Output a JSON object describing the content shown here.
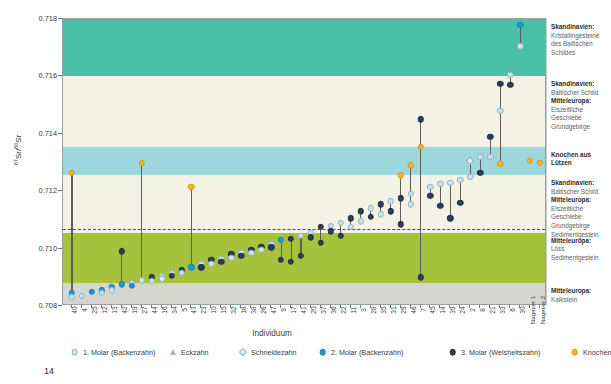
{
  "chart_data": {
    "type": "scatter",
    "title": "",
    "xlabel": "Individuum",
    "ylabel": "87Sr/86Sr",
    "ylim": [
      0.708,
      0.718
    ],
    "yticks": [
      "0.708",
      "0.710",
      "0.712",
      "0.714",
      "0.716",
      "0.718"
    ],
    "grid": false,
    "legend_position": "bottom",
    "reference_line": 0.7107,
    "categories": [
      "40",
      "4",
      "25",
      "12",
      "13",
      "42",
      "19",
      "27",
      "44",
      "16",
      "34",
      "5",
      "43",
      "23",
      "10",
      "15",
      "32",
      "18",
      "38",
      "26",
      "47",
      "9",
      "17",
      "41",
      "20",
      "37",
      "36",
      "22",
      "11",
      "3",
      "28",
      "35",
      "31",
      "29",
      "46",
      "7",
      "45",
      "14",
      "39",
      "24",
      "2",
      "8",
      "21",
      "33",
      "6",
      "30",
      "Nagetier 1",
      "Nagetier 2"
    ],
    "series": [
      {
        "name": "1. Molar (Backenzahn)",
        "marker": "circle-light",
        "color": "#cfe2ea"
      },
      {
        "name": "Eckzahn",
        "marker": "triangle-outline",
        "color": "#b9cfd8"
      },
      {
        "name": "Schneidezahn",
        "marker": "diamond-outline",
        "color": "#cfe2ea"
      },
      {
        "name": "2. Molar (Backenzahn)",
        "marker": "circle-filled",
        "color": "#1c9ad6"
      },
      {
        "name": "3. Molar (Weisheitszahn)",
        "marker": "circle-filled",
        "color": "#2d3f55"
      },
      {
        "name": "Knochen",
        "marker": "circle-filled",
        "color": "#f4b52a"
      }
    ],
    "points": [
      {
        "x": "40",
        "y": 0.70845,
        "t": "m2"
      },
      {
        "x": "40",
        "y": 0.7083,
        "t": "m1"
      },
      {
        "x": "40",
        "y": 0.71265,
        "t": "kn"
      },
      {
        "x": "4",
        "y": 0.70835,
        "t": "m1"
      },
      {
        "x": "4",
        "y": 0.70825,
        "t": "ec"
      },
      {
        "x": "25",
        "y": 0.7085,
        "t": "m2"
      },
      {
        "x": "12",
        "y": 0.70855,
        "t": "m2"
      },
      {
        "x": "12",
        "y": 0.70845,
        "t": "m1"
      },
      {
        "x": "13",
        "y": 0.70865,
        "t": "m2"
      },
      {
        "x": "13",
        "y": 0.70855,
        "t": "m1"
      },
      {
        "x": "42",
        "y": 0.70875,
        "t": "m2"
      },
      {
        "x": "42",
        "y": 0.7099,
        "t": "m3"
      },
      {
        "x": "19",
        "y": 0.7088,
        "t": "m1"
      },
      {
        "x": "19",
        "y": 0.7087,
        "t": "m2"
      },
      {
        "x": "27",
        "y": 0.7089,
        "t": "m1"
      },
      {
        "x": "27",
        "y": 0.713,
        "t": "kn"
      },
      {
        "x": "44",
        "y": 0.709,
        "t": "m3"
      },
      {
        "x": "44",
        "y": 0.70888,
        "t": "m1"
      },
      {
        "x": "16",
        "y": 0.70905,
        "t": "m1"
      },
      {
        "x": "16",
        "y": 0.70895,
        "t": "sn"
      },
      {
        "x": "34",
        "y": 0.70915,
        "t": "m1"
      },
      {
        "x": "34",
        "y": 0.70905,
        "t": "m3"
      },
      {
        "x": "5",
        "y": 0.70925,
        "t": "m3"
      },
      {
        "x": "5",
        "y": 0.70915,
        "t": "m1"
      },
      {
        "x": "43",
        "y": 0.70935,
        "t": "m2"
      },
      {
        "x": "43",
        "y": 0.71215,
        "t": "kn"
      },
      {
        "x": "23",
        "y": 0.70945,
        "t": "m1"
      },
      {
        "x": "23",
        "y": 0.70935,
        "t": "m3"
      },
      {
        "x": "10",
        "y": 0.7096,
        "t": "m3"
      },
      {
        "x": "10",
        "y": 0.70948,
        "t": "m1"
      },
      {
        "x": "15",
        "y": 0.70965,
        "t": "m1"
      },
      {
        "x": "15",
        "y": 0.70955,
        "t": "m3"
      },
      {
        "x": "32",
        "y": 0.7098,
        "t": "m3"
      },
      {
        "x": "32",
        "y": 0.70968,
        "t": "m1"
      },
      {
        "x": "18",
        "y": 0.70985,
        "t": "m1"
      },
      {
        "x": "18",
        "y": 0.70975,
        "t": "m3"
      },
      {
        "x": "38",
        "y": 0.70995,
        "t": "m3"
      },
      {
        "x": "38",
        "y": 0.70985,
        "t": "m1"
      },
      {
        "x": "26",
        "y": 0.71005,
        "t": "m3"
      },
      {
        "x": "26",
        "y": 0.70995,
        "t": "m1"
      },
      {
        "x": "47",
        "y": 0.71015,
        "t": "m1"
      },
      {
        "x": "47",
        "y": 0.71005,
        "t": "m3"
      },
      {
        "x": "9",
        "y": 0.7103,
        "t": "m2"
      },
      {
        "x": "9",
        "y": 0.7096,
        "t": "m3"
      },
      {
        "x": "17",
        "y": 0.71035,
        "t": "m3"
      },
      {
        "x": "17",
        "y": 0.70955,
        "t": "m3"
      },
      {
        "x": "41",
        "y": 0.71045,
        "t": "m1"
      },
      {
        "x": "41",
        "y": 0.70975,
        "t": "m3"
      },
      {
        "x": "20",
        "y": 0.71055,
        "t": "m1"
      },
      {
        "x": "20",
        "y": 0.7104,
        "t": "m3"
      },
      {
        "x": "37",
        "y": 0.71075,
        "t": "m3"
      },
      {
        "x": "37",
        "y": 0.7102,
        "t": "m3"
      },
      {
        "x": "36",
        "y": 0.7108,
        "t": "m1"
      },
      {
        "x": "36",
        "y": 0.7106,
        "t": "m3"
      },
      {
        "x": "22",
        "y": 0.7109,
        "t": "m1"
      },
      {
        "x": "22",
        "y": 0.71045,
        "t": "m3"
      },
      {
        "x": "11",
        "y": 0.71105,
        "t": "m3"
      },
      {
        "x": "11",
        "y": 0.71075,
        "t": "m1"
      },
      {
        "x": "3",
        "y": 0.7113,
        "t": "m3"
      },
      {
        "x": "3",
        "y": 0.71095,
        "t": "m1"
      },
      {
        "x": "28",
        "y": 0.7114,
        "t": "m1"
      },
      {
        "x": "28",
        "y": 0.7111,
        "t": "m3"
      },
      {
        "x": "35",
        "y": 0.71155,
        "t": "m3"
      },
      {
        "x": "35",
        "y": 0.7112,
        "t": "m1"
      },
      {
        "x": "31",
        "y": 0.71165,
        "t": "m1"
      },
      {
        "x": "31",
        "y": 0.7113,
        "t": "m3"
      },
      {
        "x": "29",
        "y": 0.71175,
        "t": "m3"
      },
      {
        "x": "29",
        "y": 0.71085,
        "t": "m3"
      },
      {
        "x": "46",
        "y": 0.7119,
        "t": "m1"
      },
      {
        "x": "46",
        "y": 0.71155,
        "t": "m1"
      },
      {
        "x": "7",
        "y": 0.7145,
        "t": "m3"
      },
      {
        "x": "7",
        "y": 0.709,
        "t": "m3"
      },
      {
        "x": "45",
        "y": 0.71215,
        "t": "m1"
      },
      {
        "x": "45",
        "y": 0.71185,
        "t": "m3"
      },
      {
        "x": "14",
        "y": 0.71225,
        "t": "m1"
      },
      {
        "x": "14",
        "y": 0.7115,
        "t": "m3"
      },
      {
        "x": "39",
        "y": 0.7123,
        "t": "m1"
      },
      {
        "x": "39",
        "y": 0.71105,
        "t": "m3"
      },
      {
        "x": "24",
        "y": 0.7124,
        "t": "m1"
      },
      {
        "x": "24",
        "y": 0.7116,
        "t": "m3"
      },
      {
        "x": "2",
        "y": 0.71305,
        "t": "sn"
      },
      {
        "x": "2",
        "y": 0.7125,
        "t": "m1"
      },
      {
        "x": "8",
        "y": 0.7132,
        "t": "m1"
      },
      {
        "x": "8",
        "y": 0.71265,
        "t": "m3"
      },
      {
        "x": "21",
        "y": 0.7139,
        "t": "m3"
      },
      {
        "x": "21",
        "y": 0.7132,
        "t": "m1"
      },
      {
        "x": "33",
        "y": 0.71575,
        "t": "m3"
      },
      {
        "x": "33",
        "y": 0.7148,
        "t": "m1"
      },
      {
        "x": "6",
        "y": 0.71605,
        "t": "m1"
      },
      {
        "x": "6",
        "y": 0.7157,
        "t": "m3"
      },
      {
        "x": "30",
        "y": 0.7178,
        "t": "m2"
      },
      {
        "x": "30",
        "y": 0.71705,
        "t": "m1"
      },
      {
        "x": "33",
        "y": 0.71295,
        "t": "kn"
      },
      {
        "x": "7",
        "y": 0.71355,
        "t": "kn"
      },
      {
        "x": "29",
        "y": 0.71255,
        "t": "kn"
      },
      {
        "x": "46",
        "y": 0.7129,
        "t": "kn"
      },
      {
        "x": "Nagetier 1",
        "y": 0.71305,
        "t": "kn"
      },
      {
        "x": "Nagetier 2",
        "y": 0.713,
        "t": "kn"
      }
    ]
  },
  "axis": {
    "y_label": "Sr/ Sr",
    "y_sup_left": "87",
    "y_sup_right": "86",
    "y_sr_left": "Sr/",
    "y_sr_right": "Sr",
    "x_title": "Individuum"
  },
  "right_legend": [
    {
      "head": "Skandinavien:",
      "body": "Kristallingesteine des Baltischen Schildes",
      "color": "#49bfa8"
    },
    {
      "head": "Skandinavien:",
      "body": "Baltischer Schild",
      "head2": "Mitteleuropa:",
      "body2": "Eiszeitliche Geschiebe Grundgebirge",
      "color": "#f3f2e4"
    },
    {
      "head": "Knochen aus Lützen",
      "body": "",
      "color": "#9ed6dd"
    },
    {
      "head": "Skandinavien:",
      "body": "Baltischer Schild",
      "head2": "Mitteleuropa:",
      "body2": "Eiszeitliche Geschiebe Grundgebirge Sedimentgestein",
      "color": "#f3f2e4"
    },
    {
      "head": "Mitteleuropa:",
      "body": "Löss Sedimentgestein",
      "color": "#a6c23c"
    },
    {
      "head": "Mitteleuropa:",
      "body": "Kalkstein",
      "color": "#d6d6d0"
    }
  ],
  "bottom_legend": [
    {
      "label": "1. Molar (Backenzahn)",
      "shape": "circle-light"
    },
    {
      "label": "Eckzahn",
      "shape": "triangle"
    },
    {
      "label": "Schneidezahn",
      "shape": "diamond"
    },
    {
      "label": "2. Molar (Backenzahn)",
      "shape": "circle-blue"
    },
    {
      "label": "3. Molar (Weisheitszahn)",
      "shape": "circle-dark"
    },
    {
      "label": "Knochen",
      "shape": "circle-gold"
    }
  ],
  "page_number": "14",
  "colors": {
    "band_teal": "#49bfa8",
    "band_cream": "#f3f2e4",
    "band_blue": "#9ed6dd",
    "band_olive": "#a6c23c",
    "band_gray": "#d6d6d0",
    "m1": "#cfe2ea",
    "m2": "#1c9ad6",
    "m3": "#2d3f55",
    "knochen": "#f4b52a",
    "stem": "#5c5f58"
  }
}
